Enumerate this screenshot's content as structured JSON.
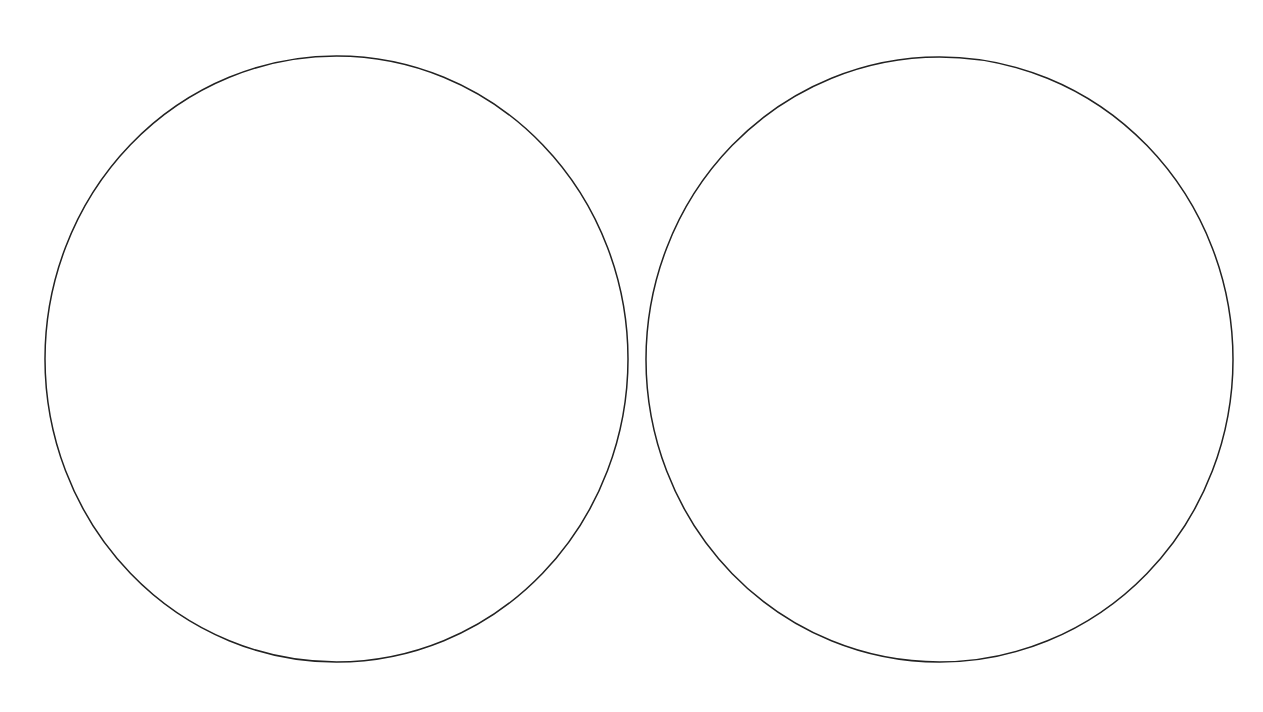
{
  "canvas": {
    "width": 1263,
    "height": 712,
    "background": "#ffffff"
  },
  "diagram": {
    "stroke_color": "#222222",
    "stroke_width": 1.5,
    "fill": "none",
    "shapes": [
      {
        "id": "left-circle",
        "type": "ellipse",
        "cx": 336.5,
        "cy": 359,
        "rx": 291.5,
        "ry": 303
      },
      {
        "id": "right-circle",
        "type": "ellipse",
        "cx": 939.5,
        "cy": 359.5,
        "rx": 293.5,
        "ry": 302.5
      }
    ]
  }
}
